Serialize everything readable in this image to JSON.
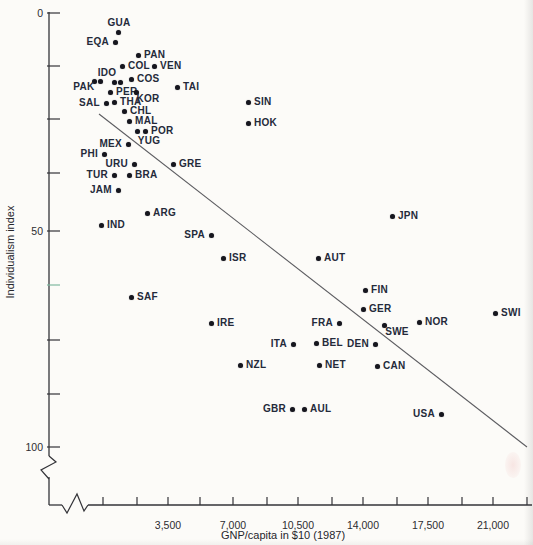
{
  "chart_data": {
    "type": "scatter",
    "title": "",
    "xlabel": "GNP/capita in $10 (1987)",
    "ylabel": "Individualism index",
    "x_axis": {
      "range": [
        0,
        23000
      ],
      "minor_tick_every": 1750,
      "labeled_ticks": [
        "3,500",
        "7,000",
        "10,500",
        "14,000",
        "17,500",
        "21,000"
      ],
      "has_break_near_origin": true
    },
    "y_axis": {
      "range": [
        0,
        100
      ],
      "inverted_top_is_zero": true,
      "labeled_ticks": [
        "0",
        "50",
        "100"
      ],
      "has_break_before_baseline": true
    },
    "grid": "off",
    "legend": "none",
    "trendline_comment": "negative-slope regression line from upper-left to lower-right",
    "points": [
      {
        "label": "GUA",
        "gnp": 800,
        "idv": 4,
        "x": 118,
        "y": 32,
        "side": "above"
      },
      {
        "label": "EQA",
        "gnp": 650,
        "idv": 7,
        "x": 115,
        "y": 42,
        "side": "left"
      },
      {
        "label": "PAN",
        "gnp": 1900,
        "idv": 10,
        "x": 138,
        "y": 55,
        "side": "right"
      },
      {
        "label": "COL",
        "gnp": 1000,
        "idv": 12,
        "x": 122,
        "y": 66,
        "side": "right"
      },
      {
        "label": "VEN",
        "gnp": 2750,
        "idv": 12,
        "x": 154,
        "y": 66,
        "side": "right"
      },
      {
        "label": "PAK",
        "gnp": 300,
        "idv": 15,
        "x": 94,
        "y": 81,
        "side": "custom",
        "lx": 84,
        "ly": 87
      },
      {
        "label": "IDO",
        "gnp": 400,
        "idv": 15,
        "x": 100,
        "y": 81,
        "side": "custom",
        "lx": 107,
        "ly": 73
      },
      {
        "label": "",
        "gnp": 600,
        "idv": 16,
        "x": 114,
        "y": 82,
        "side": "none"
      },
      {
        "label": "",
        "gnp": 900,
        "idv": 16,
        "x": 120,
        "y": 82,
        "side": "none"
      },
      {
        "label": "COS",
        "gnp": 1500,
        "idv": 15,
        "x": 131,
        "y": 79,
        "side": "right"
      },
      {
        "label": "PER",
        "gnp": 400,
        "idv": 18,
        "x": 110,
        "y": 92,
        "side": "right"
      },
      {
        "label": "KOR",
        "gnp": 1800,
        "idv": 18,
        "x": 136,
        "y": 92,
        "side": "custom",
        "lx": 148,
        "ly": 99
      },
      {
        "label": "TAI",
        "gnp": 4000,
        "idv": 17,
        "x": 177,
        "y": 87,
        "side": "right"
      },
      {
        "label": "SAL",
        "gnp": 250,
        "idv": 21,
        "x": 106,
        "y": 103,
        "side": "left"
      },
      {
        "label": "THA",
        "gnp": 600,
        "idv": 20,
        "x": 114,
        "y": 102,
        "side": "right"
      },
      {
        "label": "CHL",
        "gnp": 1100,
        "idv": 23,
        "x": 124,
        "y": 111,
        "side": "right"
      },
      {
        "label": "MAL",
        "gnp": 1400,
        "idv": 25,
        "x": 129,
        "y": 121,
        "side": "right"
      },
      {
        "label": "YUG",
        "gnp": 1800,
        "idv": 27,
        "x": 137,
        "y": 131,
        "side": "custom",
        "lx": 149,
        "ly": 141
      },
      {
        "label": "POR",
        "gnp": 2300,
        "idv": 27,
        "x": 145,
        "y": 131,
        "side": "right"
      },
      {
        "label": "MEX",
        "gnp": 1350,
        "idv": 30,
        "x": 128,
        "y": 144,
        "side": "left"
      },
      {
        "label": "PHI",
        "gnp": 250,
        "idv": 32,
        "x": 104,
        "y": 154,
        "side": "left"
      },
      {
        "label": "URU",
        "gnp": 1700,
        "idv": 35,
        "x": 134,
        "y": 164,
        "side": "left"
      },
      {
        "label": "GRE",
        "gnp": 3800,
        "idv": 35,
        "x": 173,
        "y": 164,
        "side": "right"
      },
      {
        "label": "TUR",
        "gnp": 600,
        "idv": 37,
        "x": 114,
        "y": 175,
        "side": "left"
      },
      {
        "label": "BRA",
        "gnp": 1400,
        "idv": 37,
        "x": 129,
        "y": 175,
        "side": "right"
      },
      {
        "label": "JAM",
        "gnp": 800,
        "idv": 41,
        "x": 118,
        "y": 190,
        "side": "left"
      },
      {
        "label": "SIN",
        "gnp": 7800,
        "idv": 20,
        "x": 248,
        "y": 102,
        "side": "right"
      },
      {
        "label": "HOK",
        "gnp": 7800,
        "idv": 25,
        "x": 248,
        "y": 123,
        "side": "right"
      },
      {
        "label": "ARG",
        "gnp": 2400,
        "idv": 46,
        "x": 147,
        "y": 213,
        "side": "right"
      },
      {
        "label": "IND",
        "gnp": 250,
        "idv": 49,
        "x": 101,
        "y": 225,
        "side": "right"
      },
      {
        "label": "JPN",
        "gnp": 15600,
        "idv": 47,
        "x": 392,
        "y": 216,
        "side": "right"
      },
      {
        "label": "SPA",
        "gnp": 5800,
        "idv": 51,
        "x": 211,
        "y": 235,
        "side": "left"
      },
      {
        "label": "ISR",
        "gnp": 6500,
        "idv": 56,
        "x": 223,
        "y": 258,
        "side": "right"
      },
      {
        "label": "AUT",
        "gnp": 11600,
        "idv": 56,
        "x": 318,
        "y": 258,
        "side": "right"
      },
      {
        "label": "SAF",
        "gnp": 1500,
        "idv": 65,
        "x": 131,
        "y": 297,
        "side": "right"
      },
      {
        "label": "FIN",
        "gnp": 14100,
        "idv": 64,
        "x": 365,
        "y": 290,
        "side": "right"
      },
      {
        "label": "GER",
        "gnp": 14000,
        "idv": 68,
        "x": 363,
        "y": 309,
        "side": "right"
      },
      {
        "label": "SWI",
        "gnp": 21100,
        "idv": 69,
        "x": 495,
        "y": 313,
        "side": "right"
      },
      {
        "label": "IRE",
        "gnp": 5800,
        "idv": 71,
        "x": 211,
        "y": 323,
        "side": "right"
      },
      {
        "label": "FRA",
        "gnp": 12700,
        "idv": 71,
        "x": 339,
        "y": 323,
        "side": "left"
      },
      {
        "label": "SWE",
        "gnp": 15100,
        "idv": 72,
        "x": 384,
        "y": 325,
        "side": "custom",
        "lx": 397,
        "ly": 332
      },
      {
        "label": "NOR",
        "gnp": 17000,
        "idv": 71,
        "x": 419,
        "y": 322,
        "side": "right"
      },
      {
        "label": "ITA",
        "gnp": 10200,
        "idv": 76,
        "x": 293,
        "y": 344,
        "side": "left"
      },
      {
        "label": "BEL",
        "gnp": 11500,
        "idv": 76,
        "x": 316,
        "y": 343,
        "side": "right"
      },
      {
        "label": "DEN",
        "gnp": 14600,
        "idv": 76,
        "x": 375,
        "y": 344,
        "side": "left"
      },
      {
        "label": "NZL",
        "gnp": 7400,
        "idv": 81,
        "x": 240,
        "y": 365,
        "side": "right"
      },
      {
        "label": "NET",
        "gnp": 11600,
        "idv": 81,
        "x": 319,
        "y": 365,
        "side": "right"
      },
      {
        "label": "CAN",
        "gnp": 14800,
        "idv": 81,
        "x": 377,
        "y": 366,
        "side": "right"
      },
      {
        "label": "GBR",
        "gnp": 10200,
        "idv": 91,
        "x": 292,
        "y": 409,
        "side": "left"
      },
      {
        "label": "AUL",
        "gnp": 10800,
        "idv": 91,
        "x": 304,
        "y": 409,
        "side": "right"
      },
      {
        "label": "USA",
        "gnp": 18200,
        "idv": 92,
        "x": 441,
        "y": 414,
        "side": "left"
      }
    ],
    "layout": {
      "width": 533,
      "height": 545,
      "y_axis_x": 49,
      "y_axis_top": 12,
      "x_axis_y": 505,
      "x_axis_right": 532,
      "y_break": [
        456,
        477
      ],
      "x_break": [
        62,
        88
      ],
      "tick_len_y": 13,
      "tick_len_x": 8,
      "axis_color": "#333338",
      "green_scan_tick_color": "#7fb9a1",
      "y_ticks": [
        {
          "y": 13,
          "label": "0"
        },
        {
          "y": 66
        },
        {
          "y": 119
        },
        {
          "y": 173
        },
        {
          "y": 231,
          "label": "50"
        },
        {
          "y": 285,
          "green": true
        },
        {
          "y": 340
        },
        {
          "y": 394
        },
        {
          "y": 447,
          "label": "100"
        }
      ],
      "x_ticks": [
        {
          "x": 103
        },
        {
          "x": 137
        },
        {
          "x": 168,
          "label": "3,500"
        },
        {
          "x": 200
        },
        {
          "x": 233,
          "label": "7,000"
        },
        {
          "x": 267
        },
        {
          "x": 298,
          "label": "10,500"
        },
        {
          "x": 332
        },
        {
          "x": 363,
          "label": "14,000"
        },
        {
          "x": 397
        },
        {
          "x": 428,
          "label": "17,500"
        },
        {
          "x": 462
        },
        {
          "x": 493,
          "label": "21,000"
        },
        {
          "x": 527
        }
      ],
      "trendline": {
        "x1": 99,
        "y1": 114,
        "x2": 527,
        "y2": 447,
        "color": "#5c5c60"
      }
    }
  }
}
